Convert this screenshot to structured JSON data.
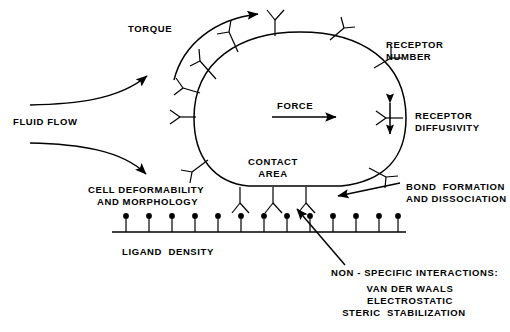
{
  "figure": {
    "title_present": false,
    "background_color": "#ffffff",
    "line_color": "#000000",
    "width": 510,
    "height": 332
  },
  "labels": {
    "torque": "TORQUE",
    "fluid_flow": "FLUID FLOW",
    "force": "FORCE",
    "receptor_number_line1": "RECEPTOR",
    "receptor_number_line2": "NUMBER",
    "receptor_diffusivity_line1": "RECEPTOR",
    "receptor_diffusivity_line2": "DIFFUSIVITY",
    "contact_area_line1": "CONTACT",
    "contact_area_line2": "AREA",
    "cell_deformability_line1": "CELL DEFORMABILITY",
    "cell_deformability_line2": "AND MORPHOLOGY",
    "bond_formation_line1": "BOND  FORMATION",
    "bond_formation_line2": "AND DISSOCIATION",
    "ligand_density": "LIGAND  DENSITY",
    "nonspecific_heading": "NON - SPECIFIC INTERACTIONS:",
    "nonspecific_item1": "VAN DER WAALS",
    "nonspecific_item2": "ELECTROSTATIC",
    "nonspecific_item3": "STERIC  STABILIZATION"
  },
  "diagram": {
    "cell": {
      "name": "cell-body",
      "shape": "rounded-blob-flat-bottom",
      "outline_path": "M 195 120 C 195 62, 240 33, 300 33 C 360 33, 405 62, 405 120 C 405 158, 385 182, 340 185 L 250 185 C 215 182, 195 158, 195 120 Z"
    },
    "surface_receptors": {
      "name": "surface-receptor",
      "glyph": "Y-shaped-antibody",
      "count": 10,
      "angles_deg": [
        250,
        228,
        205,
        180,
        152,
        128,
        108,
        88,
        60,
        34
      ]
    },
    "bound_receptors": {
      "name": "bound-receptor",
      "glyph": "inverted-Y",
      "count": 3,
      "x_positions": [
        240,
        273,
        306
      ],
      "y_top": 187
    },
    "ligands": {
      "name": "ligand-pin",
      "glyph": "pin-with-round-head",
      "count": 13,
      "x_positions": [
        126,
        149,
        172,
        195,
        218,
        241,
        264,
        287,
        310,
        333,
        356,
        379,
        396
      ],
      "baseline_y": 232,
      "head_radius": 2.8,
      "stem_height": 14
    },
    "substrate_line": {
      "name": "substrate-surface",
      "x_start": 112,
      "x_end": 406,
      "y": 232
    },
    "arrows": {
      "torque_arc": {
        "name": "torque-arrow",
        "type": "curved-arc",
        "direction": "clockwise-over-top"
      },
      "fluid_flow_upper": {
        "name": "fluid-flow-upper-arrow",
        "type": "curved-streamline",
        "direction": "up-right"
      },
      "fluid_flow_lower": {
        "name": "fluid-flow-lower-arrow",
        "type": "curved-streamline",
        "direction": "down-right"
      },
      "force": {
        "name": "force-arrow",
        "type": "straight",
        "direction": "right"
      },
      "receptor_diffusivity": {
        "name": "receptor-diffusivity-arrow",
        "type": "double-headed",
        "direction": "vertical"
      },
      "bond_formation": {
        "name": "bond-formation-pointer",
        "type": "straight",
        "direction": "left"
      },
      "nonspecific": {
        "name": "nonspecific-interactions-pointer",
        "type": "straight",
        "direction": "up-left"
      }
    }
  }
}
